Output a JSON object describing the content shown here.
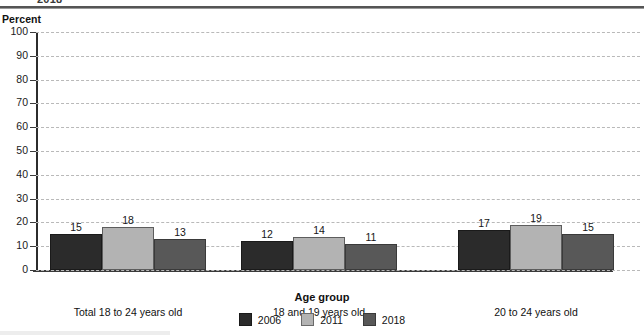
{
  "figure": {
    "clipped_top_title": "2018",
    "y_axis_unit": "Percent",
    "x_axis_title": "Age group"
  },
  "chart_data": {
    "type": "bar",
    "title": "2018",
    "xlabel": "Age group",
    "ylabel": "Percent",
    "ylim": [
      0,
      100
    ],
    "yticks": [
      0,
      10,
      20,
      30,
      40,
      50,
      60,
      70,
      80,
      90,
      100
    ],
    "grid": true,
    "legend_position": "bottom",
    "categories": [
      "Total 18 to 24 years old",
      "18 and 19 years old",
      "20 to 24 years old"
    ],
    "series": [
      {
        "name": "2006",
        "color": "#2b2b2b",
        "values": [
          15,
          12,
          17
        ]
      },
      {
        "name": "2011",
        "color": "#b3b3b3",
        "values": [
          18,
          14,
          19
        ]
      },
      {
        "name": "2018",
        "color": "#585858",
        "values": [
          13,
          11,
          15
        ]
      }
    ]
  }
}
